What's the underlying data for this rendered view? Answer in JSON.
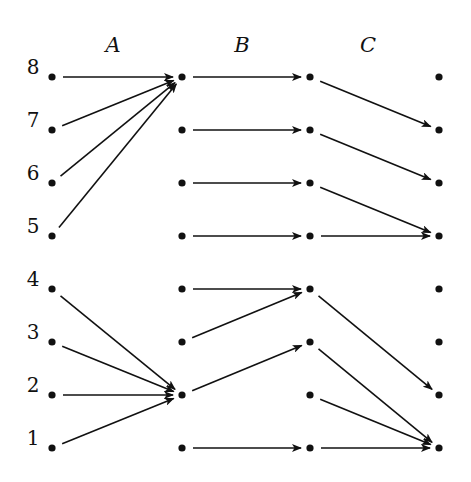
{
  "diagram": {
    "stage_labels": [
      "A",
      "B",
      "C"
    ],
    "row_labels": [
      "8",
      "7",
      "6",
      "5",
      "4",
      "3",
      "2",
      "1"
    ],
    "column_x": [
      52,
      182,
      310,
      439
    ],
    "row_y": [
      77,
      130,
      183,
      236,
      289,
      342,
      395,
      448
    ],
    "stage_label_x": [
      113,
      242,
      368
    ],
    "stage_label_y": 45,
    "row_label_x": 33,
    "colors": {
      "ink": "#111111",
      "background": "#ffffff"
    },
    "stages": [
      {
        "name": "A",
        "edges": [
          {
            "from": "8",
            "to": "8"
          },
          {
            "from": "7",
            "to": "8"
          },
          {
            "from": "6",
            "to": "8"
          },
          {
            "from": "5",
            "to": "8"
          },
          {
            "from": "4",
            "to": "2"
          },
          {
            "from": "3",
            "to": "2"
          },
          {
            "from": "2",
            "to": "2"
          },
          {
            "from": "1",
            "to": "2"
          }
        ]
      },
      {
        "name": "B",
        "edges": [
          {
            "from": "8",
            "to": "8"
          },
          {
            "from": "7",
            "to": "7"
          },
          {
            "from": "6",
            "to": "6"
          },
          {
            "from": "5",
            "to": "5"
          },
          {
            "from": "4",
            "to": "4"
          },
          {
            "from": "3",
            "to": "4"
          },
          {
            "from": "2",
            "to": "3"
          },
          {
            "from": "1",
            "to": "1"
          }
        ]
      },
      {
        "name": "C",
        "edges": [
          {
            "from": "8",
            "to": "7"
          },
          {
            "from": "7",
            "to": "6"
          },
          {
            "from": "6",
            "to": "5"
          },
          {
            "from": "5",
            "to": "5"
          },
          {
            "from": "4",
            "to": "2"
          },
          {
            "from": "3",
            "to": "1"
          },
          {
            "from": "2",
            "to": "1"
          },
          {
            "from": "1",
            "to": "1"
          }
        ]
      }
    ]
  }
}
